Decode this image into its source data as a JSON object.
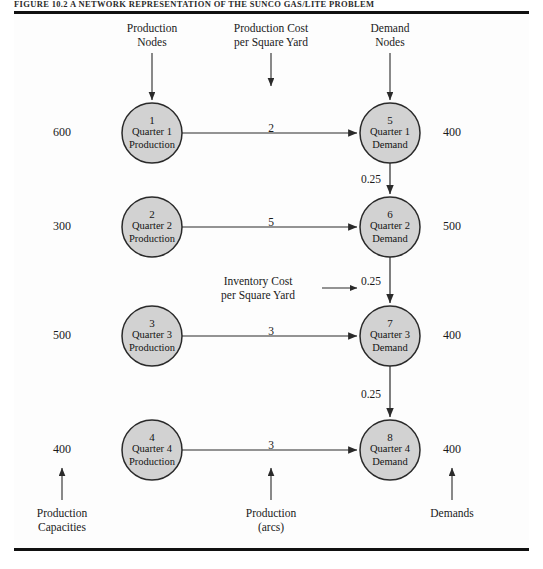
{
  "figure": {
    "title": "FIGURE 10.2  A Network Representation of the Sunco Gas/Lite Problem",
    "node_fill": "#d2d2d2",
    "node_stroke": "#2a2a2a",
    "arc_color": "#2a2a2a",
    "rule_color": "#111111"
  },
  "top_labels": [
    {
      "id": "production-nodes",
      "text": "Production\nNodes",
      "x": 152,
      "y": 22
    },
    {
      "id": "production-cost",
      "text": "Production Cost\nper Square Yard",
      "x": 271,
      "y": 22
    },
    {
      "id": "demand-nodes",
      "text": "Demand\nNodes",
      "x": 390,
      "y": 22
    }
  ],
  "bottom_labels": [
    {
      "id": "production-capacities",
      "text": "Production\nCapacities",
      "x": 62,
      "y": 507
    },
    {
      "id": "production-arcs",
      "text": "Production\n(arcs)",
      "x": 271,
      "y": 507
    },
    {
      "id": "demands",
      "text": "Demands",
      "x": 452,
      "y": 507
    }
  ],
  "annotation": {
    "id": "inventory-cost",
    "text": "Inventory Cost\nper Square Yard",
    "x": 258,
    "y": 275
  },
  "chart_data": {
    "type": "diagram",
    "title": "A Network Representation of the Sunco Gas/Lite Problem",
    "supply_nodes": [
      {
        "id": 1,
        "line1": "Quarter 1",
        "line2": "Production",
        "capacity": "600",
        "cx": 152,
        "cy": 133
      },
      {
        "id": 2,
        "line1": "Quarter 2",
        "line2": "Production",
        "capacity": "300",
        "cx": 152,
        "cy": 227
      },
      {
        "id": 3,
        "line1": "Quarter 3",
        "line2": "Production",
        "capacity": "500",
        "cx": 152,
        "cy": 336
      },
      {
        "id": 4,
        "line1": "Quarter 4",
        "line2": "Production",
        "capacity": "400",
        "cx": 152,
        "cy": 450
      }
    ],
    "demand_nodes": [
      {
        "id": 5,
        "line1": "Quarter 1",
        "line2": "Demand",
        "demand": "400",
        "cx": 390,
        "cy": 133
      },
      {
        "id": 6,
        "line1": "Quarter 2",
        "line2": "Demand",
        "demand": "500",
        "cx": 390,
        "cy": 227
      },
      {
        "id": 7,
        "line1": "Quarter 3",
        "line2": "Demand",
        "demand": "400",
        "cx": 390,
        "cy": 336
      },
      {
        "id": 8,
        "line1": "Quarter 4",
        "line2": "Demand",
        "demand": "400",
        "cx": 390,
        "cy": 450
      }
    ],
    "production_arcs": [
      {
        "from": 1,
        "to": 5,
        "cost": "2",
        "lx": 271,
        "ly": 122
      },
      {
        "from": 2,
        "to": 6,
        "cost": "5",
        "lx": 271,
        "ly": 216
      },
      {
        "from": 3,
        "to": 7,
        "cost": "3",
        "lx": 271,
        "ly": 325
      },
      {
        "from": 4,
        "to": 8,
        "cost": "3",
        "lx": 271,
        "ly": 439
      }
    ],
    "inventory_arcs": [
      {
        "from": 5,
        "to": 6,
        "cost": "0.25",
        "lx": 371,
        "ly": 173
      },
      {
        "from": 6,
        "to": 7,
        "cost": "0.25",
        "lx": 371,
        "ly": 275
      },
      {
        "from": 7,
        "to": 8,
        "cost": "0.25",
        "lx": 371,
        "ly": 388
      }
    ],
    "capacity_label_x": 62,
    "demand_label_x": 452,
    "node_radius": 30
  }
}
